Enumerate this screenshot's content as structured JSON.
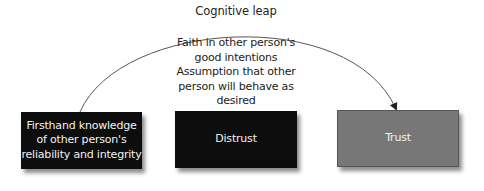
{
  "diagram": {
    "title": "Cognitive leap",
    "leap_description": {
      "lines": [
        "Faith in other person's",
        "good intentions",
        "Assumption that other",
        "person will behave as",
        "desired"
      ]
    },
    "boxes": [
      {
        "id": "knowledge",
        "lines": [
          "Firsthand knowledge",
          "of other person's",
          "reliability and integrity"
        ],
        "fill": "#0d0d0d",
        "text_color": "#f2f2f2"
      },
      {
        "id": "distrust",
        "lines": [
          "Distrust"
        ],
        "fill": "#0d0d0d",
        "text_color": "#f2f2f2"
      },
      {
        "id": "trust",
        "lines": [
          "Trust"
        ],
        "fill": "#777777",
        "text_color": "#f2f2f2"
      }
    ],
    "connector": {
      "type": "curved-arrow",
      "from": "knowledge",
      "to": "trust",
      "stroke": "#555555"
    }
  }
}
